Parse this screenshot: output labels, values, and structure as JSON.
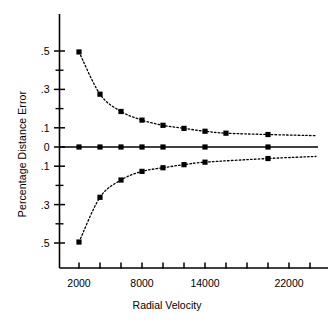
{
  "chart_data": {
    "type": "scatter",
    "title": "",
    "xlabel": "Radial Velocity",
    "ylabel": "Percentage Distance Error",
    "xlim": [
      1200,
      25200
    ],
    "ylim": [
      -0.56,
      0.56
    ],
    "grid": false,
    "legend": "none",
    "x_tick_labels": [
      "2000",
      "8000",
      "14000",
      "22000"
    ],
    "x_tick_values": [
      2000,
      8000,
      14000,
      22000
    ],
    "x_minor_tick_values": [
      4000,
      6000,
      10000,
      12000,
      16000,
      18000,
      20000,
      24000
    ],
    "y_tick_labels": [
      ".5",
      ".3",
      ".1",
      "0",
      ".1",
      ".3",
      ".5"
    ],
    "y_tick_values": [
      0.5,
      0.3,
      0.1,
      0.0,
      -0.1,
      -0.3,
      -0.5
    ],
    "y_minor_tick_values": [
      0.4,
      0.2,
      -0.2,
      -0.4
    ],
    "marker": "filled-square",
    "marker_color": "#000000",
    "line_style": "dotted",
    "axis_color": "#000000",
    "series": [
      {
        "name": "positive-error-envelope",
        "x": [
          2000,
          4000,
          6000,
          8000,
          10000,
          12000,
          14000,
          16000,
          20000
        ],
        "y": [
          0.495,
          0.275,
          0.185,
          0.14,
          0.113,
          0.097,
          0.082,
          0.072,
          0.065
        ]
      },
      {
        "name": "zero-line-points",
        "x": [
          2000,
          4000,
          6000,
          8000,
          10000,
          14000,
          20000
        ],
        "y": [
          0.0,
          0.0,
          0.0,
          0.0,
          0.0,
          0.0,
          0.0
        ]
      },
      {
        "name": "negative-error-envelope",
        "x": [
          2000,
          4000,
          6000,
          8000,
          10000,
          12000,
          14000,
          20000
        ],
        "y": [
          -0.495,
          -0.262,
          -0.172,
          -0.127,
          -0.108,
          -0.092,
          -0.079,
          -0.06
        ]
      }
    ]
  }
}
